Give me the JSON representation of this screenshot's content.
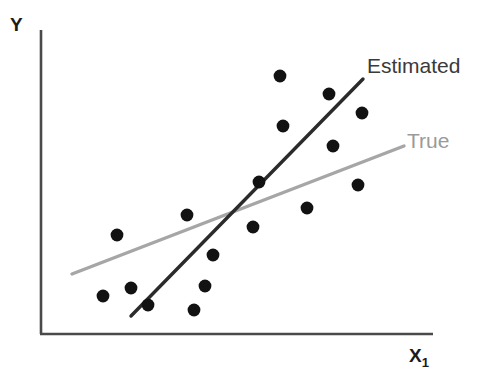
{
  "chart_data": {
    "type": "scatter",
    "title": "",
    "xlabel": "X₁",
    "ylabel": "Y",
    "grid": false,
    "legend_position": "inline-right",
    "axis_ranges": {
      "xlim": [
        0,
        100
      ],
      "ylim": [
        0,
        100
      ]
    },
    "points_note": "Scatter of 17 observations in pixel coordinates of the plotting box",
    "points": [
      {
        "x": 117,
        "y": 235
      },
      {
        "x": 103,
        "y": 296
      },
      {
        "x": 148,
        "y": 305
      },
      {
        "x": 131,
        "y": 288
      },
      {
        "x": 194,
        "y": 310
      },
      {
        "x": 187,
        "y": 215
      },
      {
        "x": 213,
        "y": 255
      },
      {
        "x": 205,
        "y": 286
      },
      {
        "x": 253,
        "y": 227
      },
      {
        "x": 259,
        "y": 182
      },
      {
        "x": 280,
        "y": 76
      },
      {
        "x": 283,
        "y": 126
      },
      {
        "x": 307,
        "y": 208
      },
      {
        "x": 329,
        "y": 94
      },
      {
        "x": 333,
        "y": 146
      },
      {
        "x": 358,
        "y": 185
      },
      {
        "x": 362,
        "y": 113
      }
    ],
    "series": [
      {
        "name": "Estimated",
        "type": "line",
        "color": "#2b2b2b",
        "width": 3.4,
        "x1": 131,
        "y1": 316,
        "x2": 363,
        "y2": 79
      },
      {
        "name": "True",
        "type": "line",
        "color": "#a6a6a6",
        "width": 3.4,
        "x1": 72,
        "y1": 274,
        "x2": 404,
        "y2": 146
      }
    ],
    "marker": {
      "shape": "circle",
      "radius": 6.4,
      "color": "#121212"
    },
    "axes": {
      "color": "#4a4a4a",
      "width": 2.6,
      "origin_x": 41,
      "origin_y": 334,
      "y_top": 30,
      "x_right": 433
    }
  },
  "labels": {
    "y_axis": "Y",
    "x_axis_base": "X",
    "x_axis_subscript": "1",
    "estimated": "Estimated",
    "true": "True"
  }
}
